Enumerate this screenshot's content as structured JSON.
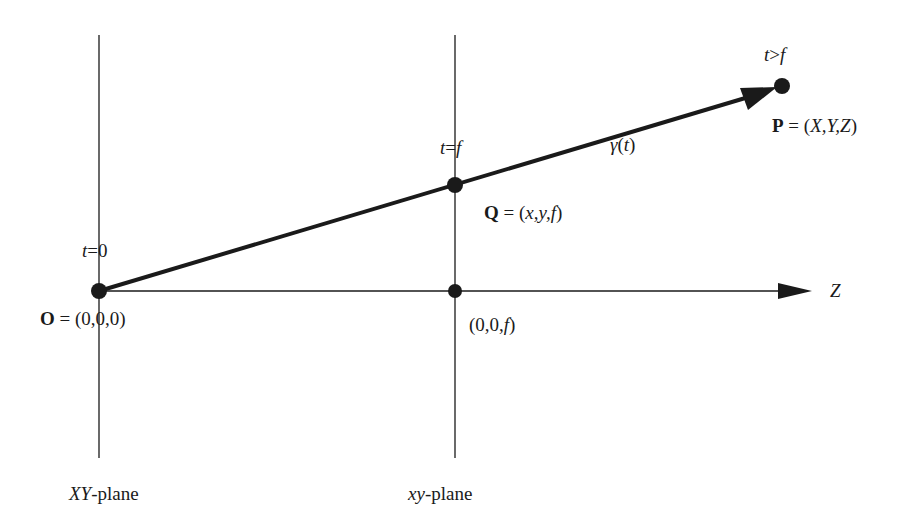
{
  "diagram": {
    "type": "pinhole camera ray projection",
    "colors": {
      "line": "#1a1a1a",
      "background": "#ffffff"
    },
    "planes": [
      {
        "id": "XY",
        "label_italic": "XY",
        "label_rest": "-plane",
        "x": 99
      },
      {
        "id": "xy",
        "label_italic": "xy",
        "label_rest": "-plane",
        "x": 455
      }
    ],
    "axis": {
      "label": "Z"
    },
    "points": {
      "O": {
        "name": "O",
        "eq": " = (0,0,0)",
        "param_italic": "t",
        "param_rest": "=0"
      },
      "Q": {
        "name": "Q",
        "eq": " = (",
        "coords_italic": "x,y,f",
        "eq_end": ")",
        "param_italic": "t",
        "param_rest": "=",
        "param_italic2": "f"
      },
      "P": {
        "name": "P",
        "eq": " = (",
        "coords_italic": "X,Y,Z",
        "eq_end": ")",
        "param_italic": "t",
        "param_rest": ">",
        "param_italic2": "f"
      },
      "F": {
        "prefix": "(0,0,",
        "italic": "f",
        "suffix": ")"
      }
    },
    "ray": {
      "label_italic": "γ",
      "label_paren_open": "(",
      "label_var": "t",
      "label_paren_close": ")"
    }
  }
}
